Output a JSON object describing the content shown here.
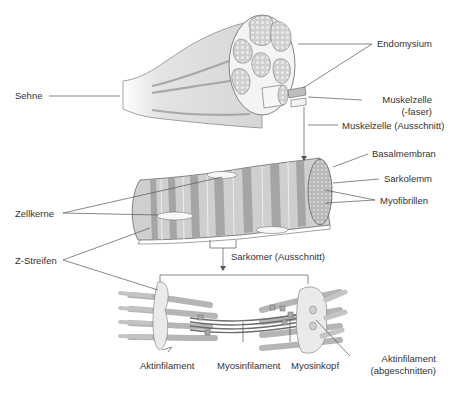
{
  "diagram": {
    "type": "anatomical-illustration",
    "colors": {
      "tissue_fill": "#d9d9d9",
      "tissue_dark": "#a6a6a6",
      "band_dark": "#9a9a9a",
      "band_light": "#c8c8c8",
      "leader_line": "#555555",
      "text": "#333333",
      "highlight": "#f2f2f2"
    },
    "levels": [
      {
        "name": "muscle",
        "labels": {
          "tendon": "Sehne",
          "endomysium": "Endomysium",
          "muscle_cell_1": "Muskelzelle",
          "muscle_cell_2": "(-faser)",
          "muscle_cell_cutout": "Muskelzelle (Ausschnitt)"
        }
      },
      {
        "name": "muscle-fiber",
        "labels": {
          "basal_membrane": "Basalmembran",
          "sarcolemma": "Sarkolemm",
          "myofibrils": "Myofibrillen",
          "nuclei": "Zellkerne",
          "z_lines": "Z-Streifen",
          "sarcomere_cutout": "Sarkomer (Ausschnitt)"
        }
      },
      {
        "name": "sarcomere",
        "labels": {
          "actin": "Aktinfilament",
          "myosin": "Myosinfilament",
          "myosin_head": "Myosinkopf",
          "actin_cut_1": "Aktinfilament",
          "actin_cut_2": "(abgeschnitten)"
        }
      }
    ]
  }
}
